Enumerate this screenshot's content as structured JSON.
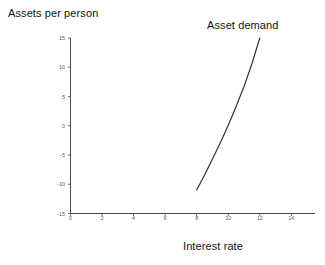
{
  "chart_data": {
    "type": "line",
    "title": "",
    "xlabel": "Interest rate",
    "ylabel": "Assets per person",
    "xlim": [
      0,
      15.5
    ],
    "ylim": [
      -15,
      15
    ],
    "grid": false,
    "legend_position": "none",
    "xticks": [
      0,
      2,
      4,
      6,
      8,
      10,
      12,
      14
    ],
    "xticklabels": [
      "0",
      "2",
      "4",
      "6",
      "8",
      "10",
      "12",
      "14"
    ],
    "yticks": [
      15,
      10,
      5,
      0,
      -5,
      -10,
      -15
    ],
    "yticklabels": [
      "15",
      "10",
      "5",
      "0",
      "-5",
      "-10",
      "-15"
    ],
    "series": [
      {
        "name": "Asset demand",
        "color": "#2b2b2b",
        "x": [
          8.0,
          8.5,
          9.0,
          9.5,
          10.0,
          10.5,
          11.0,
          11.5,
          12.0
        ],
        "y": [
          -11.0,
          -8.4,
          -5.7,
          -2.9,
          0.1,
          3.3,
          6.7,
          10.6,
          15.0
        ]
      }
    ],
    "annotations": [
      {
        "text": "Asset demand",
        "x": 11.1,
        "y": 16.6
      }
    ]
  },
  "axes": {
    "x_axis_title": "Interest rate",
    "y_axis_title": "Assets per person"
  },
  "colors": {
    "background": "#ffffff",
    "axis": "#4a4a4a",
    "curve": "#2b2b2b",
    "tick_text": "#5a5a5a",
    "title_text": "#111111"
  }
}
